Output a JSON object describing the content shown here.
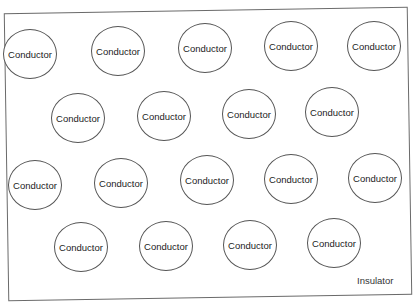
{
  "diagram": {
    "region_label": "Insulator",
    "rows": [
      {
        "items": [
          "Conductor",
          "Conductor",
          "Conductor",
          "Conductor",
          "Conductor"
        ]
      },
      {
        "items": [
          "Conductor",
          "Conductor",
          "Conductor",
          "Conductor"
        ]
      },
      {
        "items": [
          "Conductor",
          "Conductor",
          "Conductor",
          "Conductor",
          "Conductor"
        ]
      },
      {
        "items": [
          "Conductor",
          "Conductor",
          "Conductor",
          "Conductor"
        ]
      }
    ]
  }
}
